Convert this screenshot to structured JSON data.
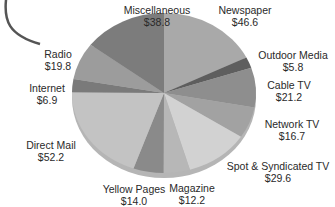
{
  "chart_data": {
    "type": "pie",
    "title": "",
    "unit": "$",
    "slices": [
      {
        "label": "Newspaper",
        "value": 46.6,
        "display": "$46.6",
        "color": "#a9a9a9"
      },
      {
        "label": "Outdoor Media",
        "value": 5.8,
        "display": "$5.8",
        "color": "#5e5e5e"
      },
      {
        "label": "Cable TV",
        "value": 21.2,
        "display": "$21.2",
        "color": "#8e8e8e"
      },
      {
        "label": "Network TV",
        "value": 16.7,
        "display": "$16.7",
        "color": "#a2a2a2"
      },
      {
        "label": "Spot & Syndicated TV",
        "value": 29.6,
        "display": "$29.6",
        "color": "#d2d2d2"
      },
      {
        "label": "Magazine",
        "value": 12.2,
        "display": "$12.2",
        "color": "#b7b7b7"
      },
      {
        "label": "Yellow Pages",
        "value": 14.0,
        "display": "$14.0",
        "color": "#8a8a8a"
      },
      {
        "label": "Direct Mail",
        "value": 52.2,
        "display": "$52.2",
        "color": "#c3c3c3"
      },
      {
        "label": "Internet",
        "value": 6.9,
        "display": "$6.9",
        "color": "#7a7a7a"
      },
      {
        "label": "Radio",
        "value": 19.8,
        "display": "$19.8",
        "color": "#9c9c9c"
      },
      {
        "label": "Miscellaneous",
        "value": 38.8,
        "display": "$38.8",
        "color": "#7c7c7c"
      }
    ]
  },
  "labels": {
    "miscellaneous": {
      "name": "Miscellaneous",
      "value": "$38.8"
    },
    "newspaper": {
      "name": "Newspaper",
      "value": "$46.6"
    },
    "outdoor": {
      "name": "Outdoor Media",
      "value": "$5.8"
    },
    "cable": {
      "name": "Cable TV",
      "value": "$21.2"
    },
    "network": {
      "name": "Network TV",
      "value": "$16.7"
    },
    "spot": {
      "name": "Spot & Syndicated TV",
      "value": "$29.6"
    },
    "magazine": {
      "name": "Magazine",
      "value": "$12.2"
    },
    "yellow": {
      "name": "Yellow Pages",
      "value": "$14.0"
    },
    "direct": {
      "name": "Direct Mail",
      "value": "$52.2"
    },
    "internet": {
      "name": "Internet",
      "value": "$6.9"
    },
    "radio": {
      "name": "Radio",
      "value": "$19.8"
    }
  }
}
